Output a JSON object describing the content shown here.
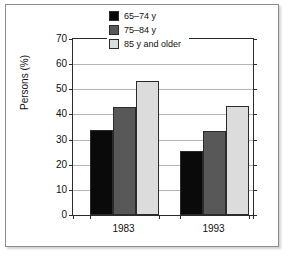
{
  "chart_data": {
    "type": "bar",
    "title": "",
    "subtitle": "",
    "xlabel": "",
    "ylabel": "Persons (%)",
    "categories": [
      "1983",
      "1993"
    ],
    "series": [
      {
        "name": "65–74 y",
        "values": [
          34,
          25.5
        ],
        "color": "#0a0a0a"
      },
      {
        "name": "75–84 y",
        "values": [
          43,
          33.5
        ],
        "color": "#585858"
      },
      {
        "name": "85 y and older",
        "values": [
          53.5,
          43.5
        ],
        "color": "#dcdcdc"
      }
    ],
    "ylim": [
      0,
      70
    ],
    "yticks": [
      0,
      10,
      20,
      30,
      40,
      50,
      60,
      70
    ],
    "ytick_labels": [
      "0",
      "10",
      "20",
      "30",
      "40",
      "50",
      "60",
      "70"
    ],
    "grid": true,
    "grid_axis": "y",
    "legend_position": "top-right",
    "frame": true
  },
  "colors": {
    "series_1": "#0a0a0a",
    "series_2": "#585858",
    "series_3": "#dcdcdc",
    "axis": "#2b2b2b",
    "grid": "#b4b4b4",
    "frame": "#8c8c8c",
    "background": "#ffffff"
  }
}
